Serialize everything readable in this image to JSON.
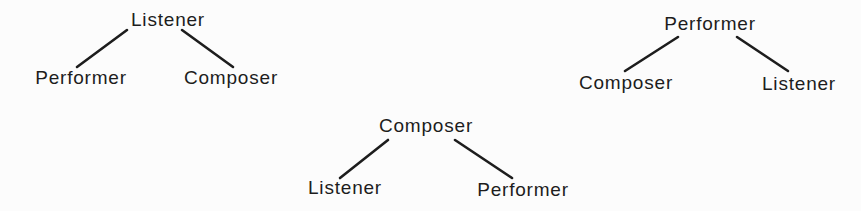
{
  "style": {
    "ink_color": "#1d1d1d",
    "background_color": "#fcfcfc"
  },
  "diagrams": [
    {
      "name": "listener-root-tree",
      "root": {
        "label": "Listener"
      },
      "children": [
        {
          "label": "Performer"
        },
        {
          "label": "Composer"
        }
      ]
    },
    {
      "name": "composer-root-tree",
      "root": {
        "label": "Composer"
      },
      "children": [
        {
          "label": "Listener"
        },
        {
          "label": "Performer"
        }
      ]
    },
    {
      "name": "performer-root-tree",
      "root": {
        "label": "Performer"
      },
      "children": [
        {
          "label": "Composer"
        },
        {
          "label": "Listener"
        }
      ]
    }
  ]
}
